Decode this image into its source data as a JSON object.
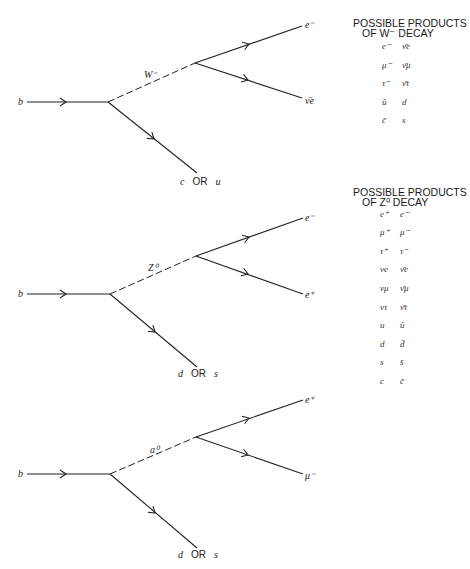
{
  "diagrams": [
    {
      "incoming": "b",
      "boson": "W⁻",
      "upper_product": "e⁻",
      "lower_product": "ν̄e",
      "spectator": {
        "a": "c",
        "or": "OR",
        "b": "u"
      },
      "legend": {
        "title_line1": "POSSIBLE PRODUCTS",
        "title_line2": "OF W⁻ DECAY",
        "rows": [
          [
            "e⁻",
            "ν̄e"
          ],
          [
            "μ⁻",
            "ν̄μ"
          ],
          [
            "τ⁻",
            "ν̄τ"
          ],
          [
            "ū",
            "d"
          ],
          [
            "c̄",
            "s"
          ]
        ]
      }
    },
    {
      "incoming": "b",
      "boson": "Z⁰",
      "upper_product": "e⁻",
      "lower_product": "e⁺",
      "spectator": {
        "a": "d",
        "or": "OR",
        "b": "s"
      },
      "legend": {
        "title_line1": "POSSIBLE PRODUCTS",
        "title_line2": "OF Z⁰ DECAY",
        "rows": [
          [
            "e⁺",
            "e⁻"
          ],
          [
            "μ⁺",
            "μ⁻"
          ],
          [
            "τ⁺",
            "τ⁻"
          ],
          [
            "νe",
            "ν̄e"
          ],
          [
            "νμ",
            "ν̄μ"
          ],
          [
            "ντ",
            "ν̄τ"
          ],
          [
            "u",
            "ū"
          ],
          [
            "d",
            "d̄"
          ],
          [
            "s",
            "s̄"
          ],
          [
            "c",
            "c̄"
          ]
        ]
      }
    },
    {
      "incoming": "b",
      "boson": "a⁰",
      "upper_product": "e⁺",
      "lower_product": "μ⁻",
      "spectator": {
        "a": "d",
        "or": "OR",
        "b": "s"
      }
    }
  ]
}
